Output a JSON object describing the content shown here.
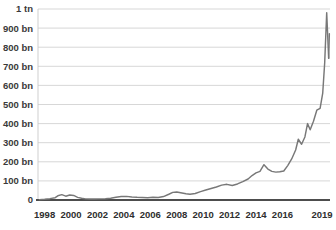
{
  "chart_data": {
    "type": "line",
    "title": "",
    "subtitle": "",
    "xlabel": "",
    "ylabel": "",
    "grid": true,
    "legend": false,
    "legend_position": "none",
    "line_color": "#787878",
    "gridline_color": "#d2d2d2",
    "baseline_color": "#4d4d4d",
    "background_color": "#ffffff",
    "xlim": [
      1997.5,
      2019.6
    ],
    "ylim": [
      0,
      1000
    ],
    "y_unit": "billions",
    "y_tick_values": [
      0,
      100,
      200,
      300,
      400,
      500,
      600,
      700,
      800,
      900,
      1000
    ],
    "y_tick_labels": [
      "0",
      "100 bn",
      "200 bn",
      "300 bn",
      "400 bn",
      "500 bn",
      "600 bn",
      "700 bn",
      "800 bn",
      "900 bn",
      "1 tn"
    ],
    "x_tick_values": [
      1998,
      2000,
      2002,
      2004,
      2006,
      2008,
      2010,
      2012,
      2014,
      2016,
      2019
    ],
    "x_tick_labels": [
      "1998",
      "2000",
      "2002",
      "2004",
      "2006",
      "2008",
      "2010",
      "2012",
      "2014",
      "2016",
      "2019"
    ],
    "x": [
      1997.6,
      1998.0,
      1998.4,
      1998.8,
      1999.0,
      1999.3,
      1999.6,
      1999.9,
      2000.2,
      2000.5,
      2000.8,
      2001.1,
      2001.4,
      2001.8,
      2002.2,
      2002.6,
      2003.0,
      2003.4,
      2003.8,
      2004.2,
      2004.6,
      2005.0,
      2005.4,
      2005.8,
      2006.2,
      2006.6,
      2007.0,
      2007.4,
      2007.7,
      2008.0,
      2008.3,
      2008.7,
      2009.0,
      2009.4,
      2009.8,
      2010.2,
      2010.6,
      2011.0,
      2011.4,
      2011.8,
      2012.2,
      2012.6,
      2013.0,
      2013.4,
      2013.7,
      2014.0,
      2014.3,
      2014.6,
      2014.9,
      2015.2,
      2015.5,
      2015.8,
      2016.1,
      2016.4,
      2016.7,
      2017.0,
      2017.2,
      2017.45,
      2017.7,
      2017.9,
      2018.1,
      2018.35,
      2018.6,
      2018.85,
      2019.05,
      2019.2,
      2019.35,
      2019.5
    ],
    "y": [
      2,
      4,
      7,
      12,
      22,
      28,
      20,
      26,
      24,
      14,
      9,
      6,
      5,
      5,
      6,
      7,
      9,
      14,
      18,
      19,
      16,
      14,
      13,
      12,
      14,
      13,
      18,
      30,
      40,
      42,
      38,
      33,
      30,
      34,
      44,
      52,
      60,
      68,
      78,
      82,
      76,
      84,
      96,
      110,
      128,
      142,
      150,
      185,
      162,
      150,
      146,
      148,
      152,
      180,
      215,
      262,
      318,
      292,
      330,
      400,
      368,
      412,
      470,
      480,
      560,
      720,
      980,
      742
    ],
    "annotations": [
      {
        "label": "peak",
        "x": 2019.35,
        "y": 980
      },
      {
        "label": "drawdown",
        "x": 2019.5,
        "y": 742
      },
      {
        "label": "rebound",
        "x": 2019.55,
        "y": 870
      },
      {
        "label": "2014 local peak",
        "x": 2014.6,
        "y": 185
      }
    ],
    "tail_segment": {
      "x": [
        2019.5,
        2019.55
      ],
      "y": [
        742,
        870
      ]
    }
  }
}
